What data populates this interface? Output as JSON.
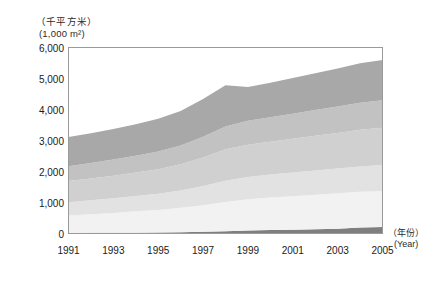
{
  "axes": {
    "y_unit_cn": "（千平方米）",
    "y_unit_en": "(1,000 m²)",
    "x_unit_cn": "（年份）",
    "x_unit_en": "(Year)",
    "y_ticks": [
      "0",
      "1,000",
      "2,000",
      "3,000",
      "4,000",
      "5,000",
      "6,000"
    ],
    "x_ticks": [
      "1991",
      "1993",
      "1995",
      "1997",
      "1999",
      "2001",
      "2003",
      "2005"
    ]
  },
  "style": {
    "frame_color": "#9a9a9a",
    "band_colors": [
      "#7f7f7f",
      "#f2f2f2",
      "#e2e2e2",
      "#d0d0d0",
      "#c2c2c2",
      "#a8a8a8"
    ]
  },
  "chart_data": {
    "type": "area",
    "title": "",
    "xlabel": "（年份）(Year)",
    "ylabel": "（千平方米）(1,000 m²)",
    "xlim": [
      1991,
      2005
    ],
    "ylim": [
      0,
      6000
    ],
    "ytick_values": [
      0,
      1000,
      2000,
      3000,
      4000,
      5000,
      6000
    ],
    "grid": false,
    "legend": "none",
    "stacked": true,
    "x": [
      1991,
      1992,
      1993,
      1994,
      1995,
      1996,
      1997,
      1998,
      1999,
      2000,
      2001,
      2002,
      2003,
      2004,
      2005
    ],
    "series": [
      {
        "name": "band-1",
        "color": "#7f7f7f",
        "values": [
          20,
          22,
          25,
          28,
          32,
          40,
          55,
          75,
          95,
          110,
          125,
          140,
          155,
          195,
          210
        ]
      },
      {
        "name": "band-2",
        "color": "#f2f2f2",
        "values": [
          560,
          600,
          640,
          690,
          730,
          790,
          860,
          940,
          1010,
          1050,
          1080,
          1110,
          1140,
          1150,
          1160
        ]
      },
      {
        "name": "band-3",
        "color": "#e2e2e2",
        "values": [
          430,
          450,
          470,
          490,
          520,
          560,
          620,
          690,
          720,
          740,
          760,
          780,
          800,
          820,
          840
        ]
      },
      {
        "name": "band-4",
        "color": "#d0d0d0",
        "values": [
          680,
          700,
          730,
          760,
          790,
          840,
          920,
          1010,
          1040,
          1060,
          1090,
          1120,
          1150,
          1180,
          1200
        ]
      },
      {
        "name": "band-5",
        "color": "#c2c2c2",
        "values": [
          480,
          500,
          520,
          540,
          570,
          610,
          670,
          740,
          770,
          790,
          810,
          830,
          850,
          870,
          890
        ]
      },
      {
        "name": "band-6",
        "color": "#a8a8a8",
        "values": [
          940,
          960,
          990,
          1020,
          1060,
          1110,
          1210,
          1330,
          1090,
          1110,
          1150,
          1190,
          1230,
          1280,
          1300
        ]
      }
    ],
    "totals": [
      3110,
      3232,
      3375,
      3528,
      3702,
      3950,
      4335,
      4785,
      4725,
      4860,
      5015,
      5170,
      5325,
      5495,
      5600
    ]
  }
}
